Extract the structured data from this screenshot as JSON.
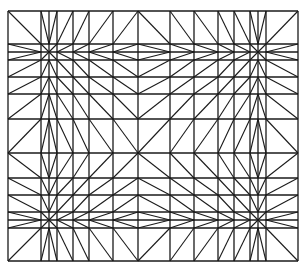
{
  "diagram": {
    "type": "triangulated-structured-mesh",
    "stroke_color": "#1a1a1a",
    "background": "#ffffff",
    "columns_x": [
      8,
      41,
      49,
      57,
      73,
      89,
      113,
      138,
      170,
      194,
      218,
      234,
      250,
      258,
      266,
      298
    ],
    "rows_y": [
      11,
      44,
      52,
      60,
      77,
      94,
      119,
      153,
      178,
      195,
      212,
      220,
      228,
      261
    ],
    "sink_columns_x": [
      49,
      258
    ],
    "sink_rows_y": [
      52,
      220
    ],
    "chevron_columns_x": [
      138,
      194
    ]
  }
}
